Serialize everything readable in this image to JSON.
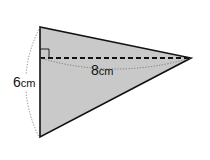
{
  "diagram": {
    "shape": "triangle",
    "fill_color": "#c9c9c9",
    "stroke_color": "#111111",
    "vertices": {
      "top": [
        40,
        27
      ],
      "bottom": [
        40,
        137
      ],
      "apex": [
        191,
        58
      ]
    },
    "height_line": {
      "from": [
        40,
        58
      ],
      "to": [
        191,
        58
      ],
      "style": "dashed"
    },
    "right_angle_marker": true
  },
  "labels": {
    "height": {
      "value": "6",
      "unit": "cm"
    },
    "base": {
      "value": "8",
      "unit": "cm"
    }
  }
}
